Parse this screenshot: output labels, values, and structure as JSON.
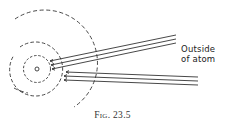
{
  "figure": {
    "label_outside_line1": "Outside",
    "label_outside_line2": "of atom",
    "caption": "Fig. 23.5",
    "elements": {
      "nucleus": "small circle at center",
      "orbits": [
        "inner dashed orbit",
        "middle dashed orbit",
        "outer dashed orbit"
      ],
      "ray_bundles": [
        {
          "name": "upper-ray-bundle",
          "lines": 3,
          "ends_at": "middle orbit",
          "arrowheads": true
        },
        {
          "name": "lower-ray-bundle",
          "lines": 3,
          "ends_at": "outer region near middle orbit",
          "arrowheads": true
        }
      ]
    },
    "colors": {
      "ink": "#333333",
      "background": "#ffffff"
    }
  }
}
